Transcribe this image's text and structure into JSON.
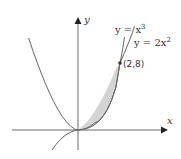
{
  "diagram": {
    "axes": {
      "x_label": "x",
      "y_label": "y"
    },
    "curves": [
      {
        "name": "cubic",
        "label": "y = x³",
        "equation": "y = x^3"
      },
      {
        "name": "parabola",
        "label": "y = 2x²",
        "equation": "y = 2x^2"
      }
    ],
    "intersection_point": {
      "label": "(2,8)",
      "x": 2,
      "y": 8
    },
    "shaded_region": {
      "between": [
        "y = 2x^2",
        "y = x^3"
      ],
      "x_from": 0,
      "x_to": 2,
      "color": "#d4d4d4"
    },
    "colors": {
      "curve": "#555555",
      "axis": "#333333",
      "fill": "#d4d4d4"
    }
  },
  "labels": {
    "cubic_base": "y = x",
    "cubic_exp": "3",
    "parabola_base": "y = 2x",
    "parabola_exp": "2",
    "point": "(2,8)",
    "x_axis": "x",
    "y_axis": "y"
  }
}
